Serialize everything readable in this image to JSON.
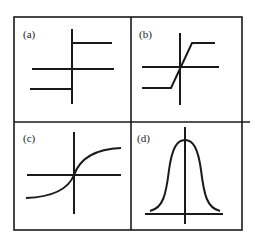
{
  "diagram": {
    "title": "",
    "layout": "2x2 grid",
    "panels": [
      {
        "label": "(a)",
        "shape": "step function (hard limiter)"
      },
      {
        "label": "(b)",
        "shape": "piecewise linear ramp (saturating linear)"
      },
      {
        "label": "(c)",
        "shape": "sigmoid curve"
      },
      {
        "label": "(d)",
        "shape": "gaussian bell curve"
      }
    ]
  },
  "colors": {
    "ink": "#1a1a1a",
    "background": "#ffffff"
  }
}
